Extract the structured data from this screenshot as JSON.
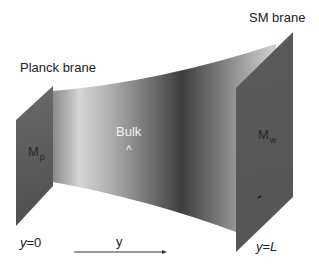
{
  "diagram": {
    "type": "randall-sundrum-brane-setup",
    "left_brane": {
      "title": "Planck brane",
      "mass_label": "M",
      "mass_subscript": "p",
      "position_var": "y",
      "position_eq": "=",
      "position_value": "0",
      "color": "#5c5c5c"
    },
    "right_brane": {
      "title": "SM brane",
      "mass_label": "M",
      "mass_subscript": "w",
      "position_var": "y",
      "position_eq": "=",
      "position_value": "L",
      "color": "#5a5a5a"
    },
    "bulk": {
      "label": "Bulk",
      "marker": "^",
      "gradient_colors": [
        "#8a8a8a",
        "#d9d9d9",
        "#8f8f8f",
        "#3d3d3d",
        "#6e6e6e",
        "#c4c4c4"
      ]
    },
    "axis": {
      "label": "y",
      "direction": "left-to-right"
    }
  }
}
